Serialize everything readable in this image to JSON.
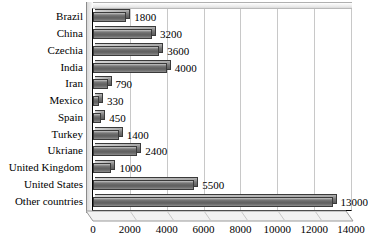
{
  "chart_data": {
    "type": "bar",
    "orientation": "horizontal",
    "title": "",
    "xlabel": "",
    "ylabel": "",
    "xlim": [
      0,
      14000
    ],
    "grid": true,
    "legend": false,
    "xticks": [
      "0",
      "2000",
      "4000",
      "6000",
      "8000",
      "10000",
      "12000",
      "14000"
    ],
    "xtick_values": [
      0,
      2000,
      4000,
      6000,
      8000,
      10000,
      12000,
      14000
    ],
    "categories": [
      "Brazil",
      "China",
      "Czechia",
      "India",
      "Iran",
      "Mexico",
      "Spain",
      "Turkey",
      "Ukriane",
      "United Kingdom",
      "United States",
      "Other countries"
    ],
    "values": [
      1800,
      3200,
      3600,
      4000,
      790,
      330,
      450,
      1400,
      2400,
      1000,
      5500,
      13000
    ],
    "data_labels": [
      "1800",
      "3200",
      "3600",
      "4000",
      "790",
      "330",
      "450",
      "1400",
      "2400",
      "1000",
      "5500",
      "13000"
    ],
    "colors": {
      "bar_fill_light": "#cfcfcf",
      "bar_fill_dark": "#5f5f5f",
      "bar_border": "#3a3a3a",
      "gridline": "#c8c8c8",
      "axis": "#000000",
      "background": "#ffffff",
      "text": "#000000"
    }
  }
}
